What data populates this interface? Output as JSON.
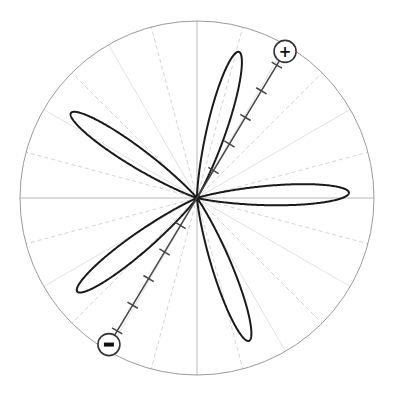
{
  "chart_data": {
    "type": "polar",
    "title": "",
    "center": [
      197,
      198
    ],
    "radius": 177,
    "grid": {
      "outer_circle": true,
      "radial_lines_every_deg": 15,
      "solid_axes_deg": [
        0,
        90,
        180,
        270
      ],
      "light_solid_deg": [
        30,
        60,
        120,
        150,
        210,
        240,
        300,
        330
      ],
      "dashed_deg": [
        15,
        45,
        75,
        105,
        135,
        165,
        195,
        225,
        255,
        285,
        315,
        345
      ]
    },
    "lobes": {
      "count": 5,
      "angles_deg": [
        2,
        74,
        146,
        218,
        290
      ],
      "max_radius_px": 152,
      "formula": "r = R * cos(5*(theta - theta0))^3 where cos > 0",
      "theta0_deg": 2
    },
    "dipole_axis": {
      "angle_deg": 59,
      "length_px": 171,
      "tick_radii_px": [
        32,
        63,
        94,
        125,
        155
      ],
      "positive_label": "+",
      "negative_label": "−"
    },
    "colors": {
      "lobe": "#1a1a1a",
      "axis": "#444444",
      "circle": "#9a9a9a",
      "grid_main": "#b8b8b8",
      "grid_light": "#e2e2e2",
      "grid_dashed": "#d4d4d4"
    }
  },
  "labels": {
    "positive_pole": "+",
    "negative_pole": "−"
  }
}
